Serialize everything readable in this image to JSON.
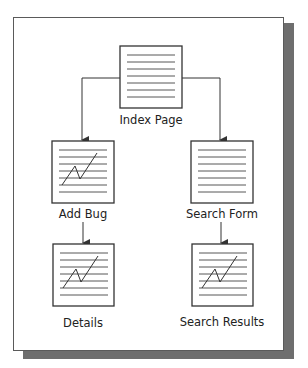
{
  "diagram": {
    "nodes": [
      {
        "id": "index",
        "label": "Index Page",
        "icon": "document-lines-icon"
      },
      {
        "id": "add_bug",
        "label": "Add Bug",
        "icon": "document-chart-icon"
      },
      {
        "id": "search_form",
        "label": "Search Form",
        "icon": "document-lines-icon"
      },
      {
        "id": "details",
        "label": "Details",
        "icon": "document-chart-icon"
      },
      {
        "id": "search_results",
        "label": "Search Results",
        "icon": "document-chart-icon"
      }
    ],
    "edges": [
      {
        "from": "index",
        "to": "add_bug"
      },
      {
        "from": "index",
        "to": "search_form"
      },
      {
        "from": "add_bug",
        "to": "details"
      },
      {
        "from": "search_form",
        "to": "search_results"
      }
    ],
    "colors": {
      "stroke": "#333333",
      "shadow": "#6e6e6e",
      "frame": "#5a5a5a"
    }
  }
}
